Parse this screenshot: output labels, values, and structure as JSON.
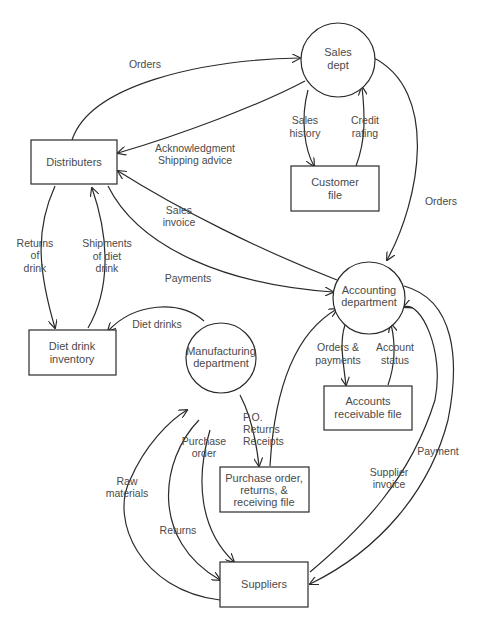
{
  "diagram": {
    "type": "data-flow-diagram",
    "nodes": {
      "sales_dept": {
        "kind": "process",
        "lines": [
          "Sales",
          "dept"
        ]
      },
      "accounting": {
        "kind": "process",
        "lines": [
          "Accounting",
          "department"
        ]
      },
      "manufacturing": {
        "kind": "process",
        "lines": [
          "Manufacturing",
          "department"
        ]
      },
      "distributers": {
        "kind": "entity",
        "lines": [
          "Distributers"
        ]
      },
      "customer_file": {
        "kind": "store",
        "lines": [
          "Customer",
          "file"
        ]
      },
      "diet_inventory": {
        "kind": "store",
        "lines": [
          "Diet drink",
          "inventory"
        ]
      },
      "ar_file": {
        "kind": "store",
        "lines": [
          "Accounts",
          "receivable file"
        ]
      },
      "po_file": {
        "kind": "store",
        "lines": [
          "Purchase order,",
          "returns, &",
          "receiving file"
        ]
      },
      "suppliers": {
        "kind": "entity",
        "lines": [
          "Suppliers"
        ]
      }
    },
    "flows": {
      "orders_dist_sales": {
        "from": "Distributers",
        "to": "Sales dept",
        "lines": [
          "Orders"
        ]
      },
      "ack_sales_dist": {
        "from": "Sales dept",
        "to": "Distributers",
        "lines": [
          "Acknowledgment",
          "Shipping advice"
        ]
      },
      "sales_history": {
        "from": "Sales dept",
        "to": "Customer file",
        "lines": [
          "Sales",
          "history"
        ]
      },
      "credit_rating": {
        "from": "Customer file",
        "to": "Sales dept",
        "lines": [
          "Credit",
          "rating"
        ]
      },
      "orders_sales_acct": {
        "from": "Sales dept",
        "to": "Accounting department",
        "lines": [
          "Orders"
        ]
      },
      "sales_invoice": {
        "from": "Accounting department",
        "to": "Distributers",
        "lines": [
          "Sales",
          "invoice"
        ]
      },
      "payments": {
        "from": "Distributers",
        "to": "Accounting department",
        "lines": [
          "Payments"
        ]
      },
      "returns_of_drink": {
        "from": "Distributers",
        "to": "Diet drink inventory",
        "lines": [
          "Returns",
          "of",
          "drink"
        ]
      },
      "shipments": {
        "from": "Diet drink inventory",
        "to": "Distributers",
        "lines": [
          "Shipments",
          "of diet",
          "drink"
        ]
      },
      "diet_drinks": {
        "from": "Manufacturing department",
        "to": "Diet drink inventory",
        "lines": [
          "Diet drinks"
        ]
      },
      "orders_payments": {
        "from": "Accounting department",
        "to": "Accounts receivable file",
        "lines": [
          "Orders &",
          "payments"
        ]
      },
      "account_status": {
        "from": "Accounts receivable file",
        "to": "Accounting department",
        "lines": [
          "Account",
          "status"
        ]
      },
      "po_returns_receipts": {
        "from": "Manufacturing department",
        "to": "Purchase order, returns, & receiving file",
        "lines": [
          "P.O.",
          "Returns",
          "Receipts"
        ]
      },
      "po_file_to_acct": {
        "from": "Purchase order, returns, & receiving file",
        "to": "Accounting department",
        "lines": []
      },
      "raw_materials": {
        "from": "Suppliers",
        "to": "Manufacturing department",
        "lines": [
          "Raw",
          "materials"
        ]
      },
      "returns": {
        "from": "Manufacturing department",
        "to": "Suppliers",
        "lines": [
          "Returns"
        ]
      },
      "purchase_order": {
        "from": "Manufacturing department",
        "to": "Suppliers",
        "lines": [
          "Purchase",
          "order"
        ]
      },
      "supplier_invoice": {
        "from": "Suppliers",
        "to": "Accounting department",
        "lines": [
          "Supplier",
          "invoice"
        ]
      },
      "payment": {
        "from": "Accounting department",
        "to": "Suppliers",
        "lines": [
          "Payment"
        ]
      }
    }
  }
}
